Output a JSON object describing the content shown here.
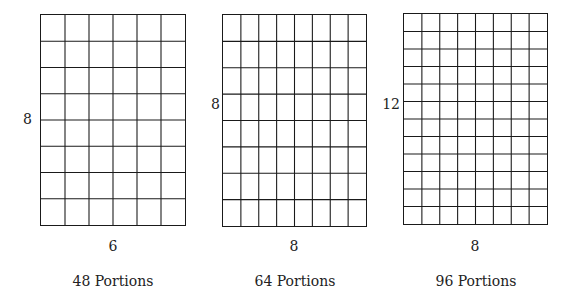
{
  "figures": [
    {
      "id": "grid-6x8",
      "columns": 6,
      "rows": 8,
      "side_label": "8",
      "bottom_label": "6",
      "caption": "48 Portions",
      "box": {
        "left": 40,
        "top": 14,
        "width": 146,
        "height": 212
      }
    },
    {
      "id": "grid-8x8",
      "columns": 8,
      "rows": 8,
      "side_label": "8",
      "bottom_label": "8",
      "caption": "64 Portions",
      "box": {
        "left": 222,
        "top": 14,
        "width": 145,
        "height": 213
      }
    },
    {
      "id": "grid-8x12",
      "columns": 8,
      "rows": 12,
      "side_label": "12",
      "bottom_label": "8",
      "caption": "96 Portions",
      "box": {
        "left": 403,
        "top": 13,
        "width": 145,
        "height": 212
      }
    }
  ],
  "colors": {
    "line": "#1a1a1a",
    "background": "#ffffff",
    "text": "#222222"
  }
}
